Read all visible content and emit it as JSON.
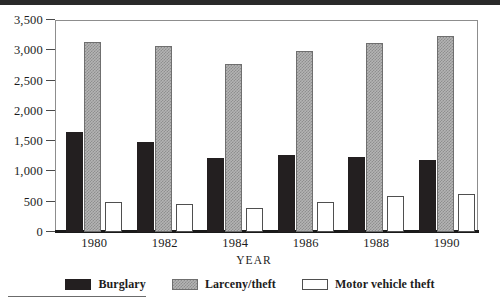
{
  "chart_data": {
    "type": "bar",
    "title": "",
    "xlabel": "YEAR",
    "ylabel": "",
    "categories": [
      "1980",
      "1982",
      "1984",
      "1986",
      "1988",
      "1990"
    ],
    "series": [
      {
        "name": "Burglary",
        "values": [
          1650,
          1480,
          1230,
          1270,
          1240,
          1190
        ]
      },
      {
        "name": "Larceny/theft",
        "values": [
          3140,
          3070,
          2780,
          2990,
          3120,
          3230
        ]
      },
      {
        "name": "Motor vehicle theft",
        "values": [
          500,
          460,
          400,
          490,
          590,
          630
        ]
      }
    ],
    "ylim": [
      0,
      3500
    ],
    "ytick_values": [
      0,
      500,
      1000,
      1500,
      2000,
      2500,
      3000,
      3500
    ],
    "ytick_labels": [
      "0",
      "500",
      "1,000",
      "1,500",
      "2,000",
      "2,500",
      "3,000",
      "3,500"
    ],
    "grid": false,
    "legend_position": "bottom",
    "colors": {
      "burglary": "#231f20",
      "larceny": "#b4b4b4",
      "motor": "#ffffff",
      "axis": "#1a1a1a",
      "frame": "#8d8d8d"
    }
  },
  "legend": {
    "items": [
      {
        "label": "Burglary",
        "swatch": "solid-black-swatch"
      },
      {
        "label": "Larceny/theft",
        "swatch": "hatched-gray-swatch"
      },
      {
        "label": "Motor vehicle theft",
        "swatch": "white-outline-swatch"
      }
    ]
  }
}
